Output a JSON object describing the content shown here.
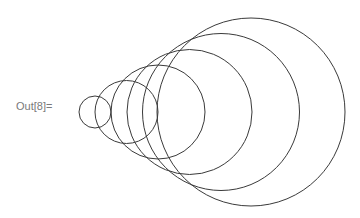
{
  "cell": {
    "output_label": "Out[8]="
  },
  "graphic": {
    "stroke_color": "#3a3a3a",
    "background": "#ffffff",
    "circles": [
      {
        "cx": 95,
        "cy": 112,
        "r": 16
      },
      {
        "cx": 126.5,
        "cy": 112,
        "r": 31.5
      },
      {
        "cx": 158,
        "cy": 112,
        "r": 47
      },
      {
        "cx": 189.5,
        "cy": 112,
        "r": 62.5
      },
      {
        "cx": 221,
        "cy": 112,
        "r": 78.5
      },
      {
        "cx": 251,
        "cy": 112,
        "r": 94
      }
    ]
  }
}
